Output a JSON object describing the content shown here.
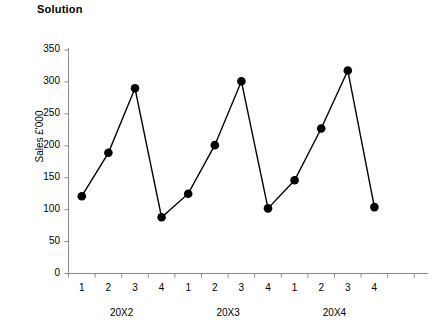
{
  "title": "Solution",
  "chart_data": {
    "type": "line",
    "title": "Solution",
    "xlabel": "",
    "ylabel": "Sales £'000",
    "ylim": [
      0,
      350
    ],
    "ytick_step": 50,
    "yticks": [
      0,
      50,
      100,
      150,
      200,
      250,
      300,
      350
    ],
    "grid": false,
    "legend": "none",
    "marker": "filled-circle",
    "line_color": "#000000",
    "marker_color": "#000000",
    "categories": [
      "1",
      "2",
      "3",
      "4",
      "1",
      "2",
      "3",
      "4",
      "1",
      "2",
      "3",
      "4"
    ],
    "values": [
      121,
      189,
      290,
      88,
      125,
      201,
      301,
      102,
      146,
      227,
      318,
      104
    ],
    "groups": [
      {
        "label": "20X2",
        "quarters": [
          "1",
          "2",
          "3",
          "4"
        ],
        "values": [
          121,
          189,
          290,
          88
        ]
      },
      {
        "label": "20X3",
        "quarters": [
          "1",
          "2",
          "3",
          "4"
        ],
        "values": [
          125,
          201,
          301,
          102
        ]
      },
      {
        "label": "20X4",
        "quarters": [
          "1",
          "2",
          "3",
          "4"
        ],
        "values": [
          146,
          227,
          318,
          104
        ]
      }
    ],
    "series": [
      {
        "name": "Sales",
        "values": [
          121,
          189,
          290,
          88,
          125,
          201,
          301,
          102,
          146,
          227,
          318,
          104
        ]
      }
    ]
  },
  "axes": {
    "y_label": "Sales £'000",
    "y_ticks": [
      "350",
      "300",
      "250",
      "200",
      "150",
      "100",
      "50",
      "0"
    ],
    "x_ticks": [
      "1",
      "2",
      "3",
      "4",
      "1",
      "2",
      "3",
      "4",
      "1",
      "2",
      "3",
      "4"
    ],
    "x_groups": [
      "20X2",
      "20X3",
      "20X4"
    ]
  }
}
